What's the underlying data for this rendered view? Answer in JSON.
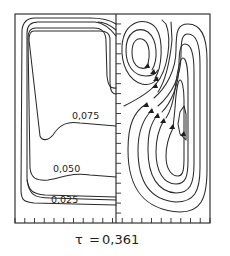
{
  "figure": {
    "left_panel": {
      "kind": "isolines",
      "contour_labels": [
        "0,075",
        "0,050",
        "0,025"
      ]
    },
    "right_panel": {
      "kind": "streamlines",
      "vortices": [
        "upper-left counter-rotating cell",
        "large right cell"
      ],
      "arrow_direction": "upward along inner side"
    },
    "caption": {
      "symbol": "τ",
      "equals": "=",
      "value": "0,361"
    }
  }
}
